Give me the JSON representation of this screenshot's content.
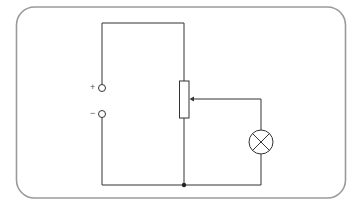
{
  "diagram": {
    "type": "circuit-schematic",
    "colors": {
      "frame": "#9a9a9a",
      "wire": "#333333",
      "background": "#ffffff"
    },
    "terminals": [
      {
        "id": "positive-terminal",
        "label": "+"
      },
      {
        "id": "negative-terminal",
        "label": "−"
      }
    ],
    "components": [
      {
        "id": "potentiometer",
        "kind": "variable resistor with wiper"
      },
      {
        "id": "lamp",
        "kind": "lamp (circle with X)"
      },
      {
        "id": "junction",
        "kind": "junction dot"
      }
    ]
  }
}
